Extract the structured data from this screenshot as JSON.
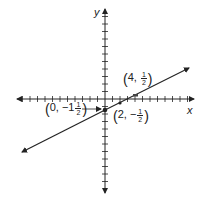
{
  "chart_data": {
    "type": "line",
    "title": "",
    "xlabel": "x",
    "ylabel": "y",
    "xlim": [
      -12,
      12
    ],
    "ylim": [
      -12,
      12
    ],
    "grid": false,
    "legend": null,
    "tick_spacing": 1,
    "series": [
      {
        "name": "line",
        "slope": 0.5,
        "intercept": -1.5,
        "x": [
          -11,
          11
        ],
        "y": [
          -7,
          4
        ],
        "arrows_both_ends": true
      }
    ],
    "points": [
      {
        "x": 0,
        "y": -1.5,
        "label_whole": "0",
        "label_sign": "−",
        "label_int": "1",
        "label_num": "1",
        "label_den": "2"
      },
      {
        "x": 2,
        "y": -0.5,
        "label_whole": "2",
        "label_sign": "−",
        "label_num": "1",
        "label_den": "2"
      },
      {
        "x": 4,
        "y": 0.5,
        "label_whole": "4",
        "label_num": "1",
        "label_den": "2"
      }
    ],
    "annotations": [
      {
        "text": "(0, −1 1/2)",
        "arrow_to": [
          0,
          -1.5
        ]
      },
      {
        "text": "(2, −1/2)"
      },
      {
        "text": "(4, 1/2)"
      }
    ]
  },
  "labels": {
    "x_axis": "x",
    "y_axis": "y",
    "p0": {
      "open": "(",
      "a": "0,",
      "sign": "−",
      "int": "1",
      "num": "1",
      "den": "2",
      "close": ")"
    },
    "p1": {
      "open": "(",
      "a": "2,",
      "sign": "−",
      "num": "1",
      "den": "2",
      "close": ")"
    },
    "p2": {
      "open": "(",
      "a": "4,",
      "num": "1",
      "den": "2",
      "close": ")"
    }
  },
  "colors": {
    "ink": "#222222",
    "background": "#ffffff"
  }
}
